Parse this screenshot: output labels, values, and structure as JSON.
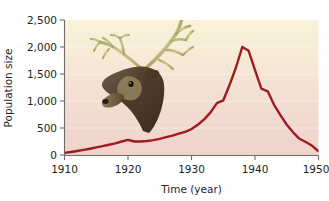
{
  "figure": {
    "background_color": "#fefefe",
    "plot_gradient_top": "#faf2da",
    "plot_gradient_mid": "#f6e6d8",
    "plot_gradient_bottom": "#efd3cc"
  },
  "chart_data": {
    "type": "line",
    "title": "",
    "xlabel": "Time (year)",
    "ylabel": "Population size",
    "xlim": [
      1910,
      1950
    ],
    "ylim": [
      0,
      2500
    ],
    "xticks": [
      1910,
      1920,
      1930,
      1940,
      1950
    ],
    "xtick_labels": [
      "1910",
      "1920",
      "1930",
      "1940",
      "1950"
    ],
    "yticks": [
      0,
      500,
      1000,
      1500,
      2000,
      2500
    ],
    "ytick_labels": [
      "0",
      "500",
      "1,000",
      "1,500",
      "2,000",
      "2,500"
    ],
    "grid": true,
    "grid_orientation": "horizontal",
    "legend": false,
    "legend_position": "none",
    "line_color": "#9e1b22",
    "line_width": 2.4,
    "series": [
      {
        "name": "Reindeer population",
        "x": [
          1910,
          1911,
          1912,
          1913,
          1914,
          1915,
          1916,
          1917,
          1918,
          1919,
          1920,
          1921,
          1922,
          1923,
          1924,
          1925,
          1926,
          1927,
          1928,
          1929,
          1930,
          1931,
          1932,
          1933,
          1934,
          1935,
          1936,
          1937,
          1938,
          1939,
          1940,
          1941,
          1942,
          1943,
          1944,
          1945,
          1946,
          1947,
          1948,
          1949,
          1950
        ],
        "values": [
          40,
          55,
          75,
          95,
          115,
          140,
          165,
          190,
          215,
          250,
          280,
          250,
          250,
          260,
          275,
          300,
          330,
          360,
          395,
          430,
          480,
          560,
          660,
          790,
          960,
          1010,
          1300,
          1620,
          2000,
          1930,
          1570,
          1230,
          1180,
          930,
          740,
          560,
          420,
          300,
          240,
          170,
          70
        ]
      }
    ],
    "annotations": [
      {
        "name": "reindeer-head-illustration",
        "description": "Reindeer (caribou) head with large branching antlers",
        "x_range": [
          1919,
          1930
        ],
        "y_range": [
          300,
          2350
        ]
      }
    ]
  }
}
